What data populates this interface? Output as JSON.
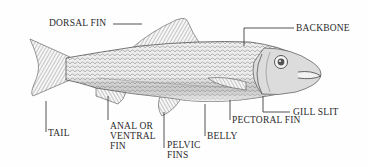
{
  "diagram": {
    "colors": {
      "ink": "#2a2a2a",
      "shade": "#8a8a8a",
      "background": "#fefefe"
    },
    "labels": [
      {
        "id": "dorsal-fin",
        "text": "DORSAL FIN"
      },
      {
        "id": "backbone",
        "text": "BACKBONE"
      },
      {
        "id": "tail",
        "text": "TAIL"
      },
      {
        "id": "anal-fin",
        "text": "ANAL OR\nVENTRAL\nFIN"
      },
      {
        "id": "pelvic-fins",
        "text": "PELVIC\nFINS"
      },
      {
        "id": "belly",
        "text": "BELLY"
      },
      {
        "id": "pectoral-fin",
        "text": "PECTORAL FIN"
      },
      {
        "id": "gill-slit",
        "text": "GILL SLIT"
      }
    ]
  }
}
